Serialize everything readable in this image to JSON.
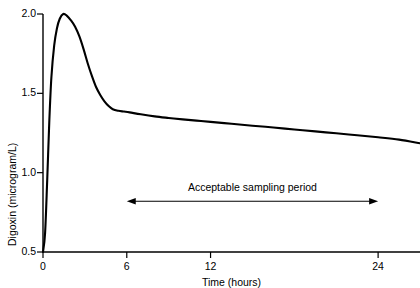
{
  "chart_data": {
    "type": "line",
    "title": "",
    "xlabel": "Time (hours)",
    "ylabel": "Digoxin (microgram/L)",
    "xlim": [
      0,
      27
    ],
    "ylim": [
      0.5,
      2.0
    ],
    "xticks": [
      0,
      6,
      12,
      24
    ],
    "xticklabels": [
      "0",
      "6",
      "12",
      "24"
    ],
    "yticks": [
      0.5,
      1.0,
      1.5,
      2.0
    ],
    "yticklabels": [
      "0.5",
      "1.0",
      "1.5",
      "2.0"
    ],
    "grid": false,
    "legend": null,
    "series": [
      {
        "name": "Digoxin plasma concentration",
        "x": [
          0.0,
          0.15,
          0.3,
          0.45,
          0.6,
          0.8,
          1.0,
          1.2,
          1.45,
          1.7,
          2.0,
          2.3,
          2.6,
          2.9,
          3.2,
          3.5,
          3.8,
          4.1,
          4.4,
          4.7,
          5.0,
          5.4,
          5.8,
          6.2,
          7.0,
          8.0,
          9.0,
          10.0,
          11.0,
          12.0,
          13.5,
          15.0,
          16.5,
          18.0,
          19.5,
          21.0,
          22.5,
          24.0,
          25.5,
          27.0
        ],
        "y": [
          0.5,
          0.62,
          0.95,
          1.32,
          1.6,
          1.8,
          1.91,
          1.97,
          2.0,
          1.99,
          1.96,
          1.92,
          1.86,
          1.78,
          1.69,
          1.61,
          1.54,
          1.49,
          1.45,
          1.42,
          1.4,
          1.39,
          1.385,
          1.38,
          1.368,
          1.355,
          1.345,
          1.336,
          1.328,
          1.32,
          1.308,
          1.296,
          1.285,
          1.272,
          1.26,
          1.248,
          1.236,
          1.223,
          1.208,
          1.185
        ]
      }
    ],
    "annotations": [
      {
        "name": "acceptable-sampling-period",
        "text": "Acceptable sampling period",
        "arrow": "double",
        "x_start": 6,
        "x_end": 24,
        "y": 0.82
      }
    ]
  }
}
